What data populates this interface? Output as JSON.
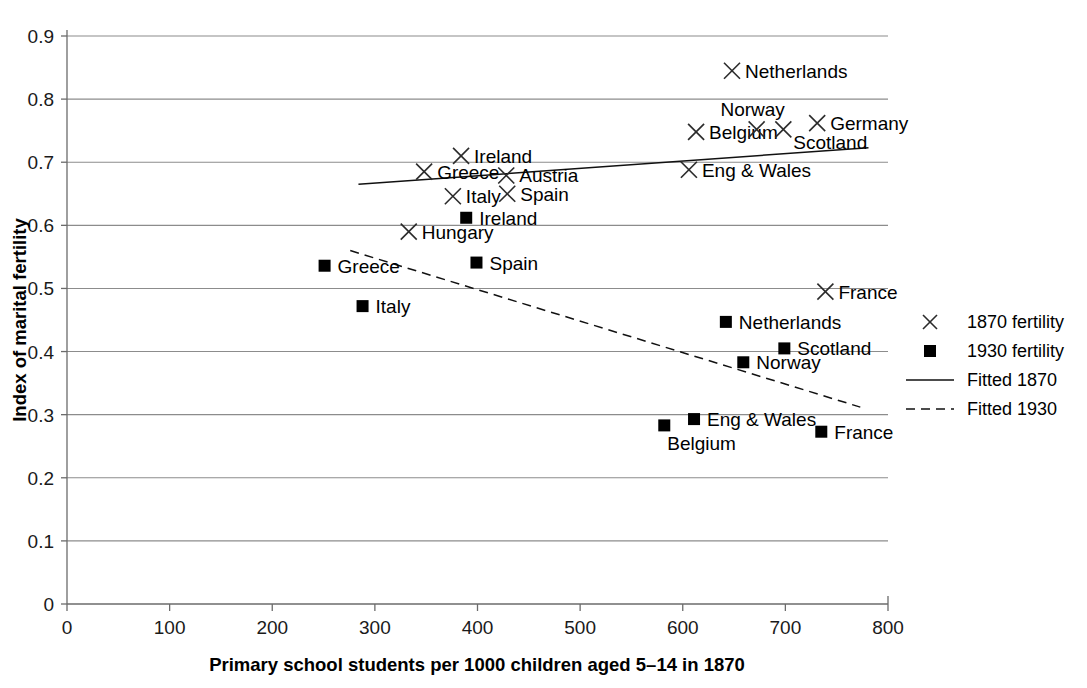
{
  "chart_data": {
    "type": "scatter",
    "title": "",
    "xlabel": "Primary school students per 1000 children aged 5–14 in 1870",
    "ylabel": "Index of marital fertility",
    "xlim": [
      0,
      800
    ],
    "ylim": [
      0,
      0.9
    ],
    "xticks": [
      "0",
      "100",
      "200",
      "300",
      "400",
      "500",
      "600",
      "700",
      "800"
    ],
    "yticks": [
      "0",
      "0.1",
      "0.2",
      "0.3",
      "0.4",
      "0.5",
      "0.6",
      "0.7",
      "0.8",
      "0.9"
    ],
    "grid": "horizontal",
    "legend_position": "right",
    "series": [
      {
        "name": "1870 fertility",
        "marker": "x",
        "points": [
          {
            "label": "Greece",
            "x": 348,
            "y": 0.685,
            "label_side": "right"
          },
          {
            "label": "Italy",
            "x": 376,
            "y": 0.646,
            "label_side": "right"
          },
          {
            "label": "Ireland",
            "x": 384,
            "y": 0.71,
            "label_side": "right"
          },
          {
            "label": "Austria",
            "x": 428,
            "y": 0.679,
            "label_side": "right"
          },
          {
            "label": "Spain",
            "x": 429,
            "y": 0.65,
            "label_side": "right"
          },
          {
            "label": "Hungary",
            "x": 333,
            "y": 0.59,
            "label_side": "right"
          },
          {
            "label": "Belgium",
            "x": 613,
            "y": 0.748,
            "label_side": "right"
          },
          {
            "label": "Norway",
            "x": 672,
            "y": 0.752,
            "label_side": "above"
          },
          {
            "label": "Scotland",
            "x": 698,
            "y": 0.752,
            "label_side": "belowright"
          },
          {
            "label": "Germany",
            "x": 731,
            "y": 0.762,
            "label_side": "right"
          },
          {
            "label": "Eng & Wales",
            "x": 606,
            "y": 0.688,
            "label_side": "right"
          },
          {
            "label": "Netherlands",
            "x": 648,
            "y": 0.845,
            "label_side": "right"
          },
          {
            "label": "France",
            "x": 739,
            "y": 0.495,
            "label_side": "right"
          }
        ]
      },
      {
        "name": "1930 fertility",
        "marker": "square",
        "points": [
          {
            "label": "Greece",
            "x": 251,
            "y": 0.536,
            "label_side": "right"
          },
          {
            "label": "Italy",
            "x": 288,
            "y": 0.472,
            "label_side": "right"
          },
          {
            "label": "Spain",
            "x": 399,
            "y": 0.541,
            "label_side": "right"
          },
          {
            "label": "Ireland",
            "x": 389,
            "y": 0.612,
            "label_side": "right"
          },
          {
            "label": "Netherlands",
            "x": 642,
            "y": 0.447,
            "label_side": "right"
          },
          {
            "label": "Scotland",
            "x": 699,
            "y": 0.405,
            "label_side": "right"
          },
          {
            "label": "Norway",
            "x": 659,
            "y": 0.383,
            "label_side": "right"
          },
          {
            "label": "Eng & Wales",
            "x": 611,
            "y": 0.293,
            "label_side": "right"
          },
          {
            "label": "Belgium",
            "x": 582,
            "y": 0.283,
            "label_side": "below"
          },
          {
            "label": "France",
            "x": 735,
            "y": 0.273,
            "label_side": "right"
          }
        ]
      }
    ],
    "fit_lines": [
      {
        "name": "Fitted 1870",
        "style": "solid",
        "x1": 284,
        "y1": 0.665,
        "x2": 781,
        "y2": 0.723
      },
      {
        "name": "Fitted 1930",
        "style": "dashed",
        "x1": 276,
        "y1": 0.56,
        "x2": 773,
        "y2": 0.312
      }
    ],
    "legend": [
      {
        "label": "1870 fertility",
        "marker": "x"
      },
      {
        "label": "1930 fertility",
        "marker": "square"
      },
      {
        "label": "Fitted 1870",
        "marker": "line-solid"
      },
      {
        "label": "Fitted 1930",
        "marker": "line-dashed"
      }
    ]
  }
}
